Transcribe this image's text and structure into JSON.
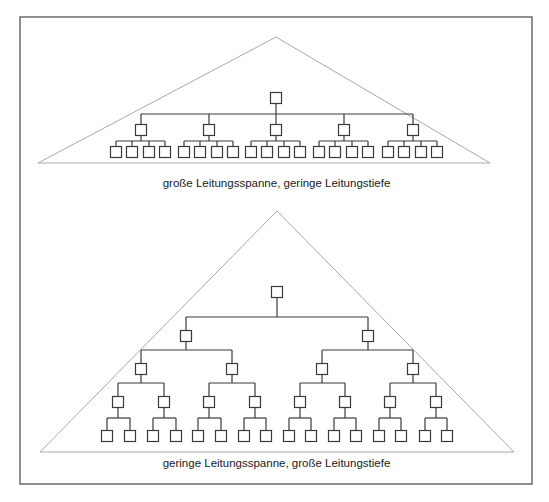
{
  "figure": {
    "frame": {
      "x": 20,
      "y": 17,
      "width": 512,
      "height": 467,
      "stroke": "#555555"
    },
    "colors": {
      "triangle_stroke": "#a8a8a8",
      "tree_stroke": "#3a3a3a",
      "box_fill": "#ffffff",
      "text": "#1a1a1a"
    }
  },
  "diagrams": [
    {
      "id": "wide",
      "caption": "große Leitungsspanne, geringe Leitungstiefe",
      "caption_y": 177,
      "triangle": {
        "apex": [
          276,
          37
        ],
        "left": [
          38,
          163
        ],
        "right": [
          490,
          163
        ]
      },
      "box_size": 11,
      "root": {
        "x": 276,
        "y": 98
      },
      "bus_y": 114,
      "groups": [
        {
          "x": 141,
          "y": 130,
          "child_bus_y": 141,
          "leaves": [
            116,
            132,
            149,
            165
          ],
          "leaf_y": 152
        },
        {
          "x": 209,
          "y": 130,
          "child_bus_y": 141,
          "leaves": [
            184,
            200,
            217,
            233
          ],
          "leaf_y": 152
        },
        {
          "x": 276,
          "y": 130,
          "child_bus_y": 141,
          "leaves": [
            251,
            267,
            284,
            300
          ],
          "leaf_y": 152
        },
        {
          "x": 344,
          "y": 130,
          "child_bus_y": 141,
          "leaves": [
            319,
            335,
            352,
            368
          ],
          "leaf_y": 152
        },
        {
          "x": 413,
          "y": 130,
          "child_bus_y": 141,
          "leaves": [
            388,
            404,
            421,
            437
          ],
          "leaf_y": 152
        }
      ]
    },
    {
      "id": "deep",
      "caption": "geringe Leitungsspanne, große Leitungstiefe",
      "caption_y": 457,
      "triangle": {
        "apex": [
          277,
          211
        ],
        "left": [
          40,
          452
        ],
        "right": [
          514,
          452
        ]
      },
      "box_size": 11,
      "levels_y": [
        292,
        336,
        369,
        402,
        436
      ],
      "bus_y": [
        317,
        350,
        383,
        418
      ],
      "tree": {
        "x": 277,
        "children": [
          {
            "x": 186,
            "children": [
              {
                "x": 141,
                "children": [
                  {
                    "x": 118,
                    "children": [
                      {
                        "x": 107
                      },
                      {
                        "x": 130
                      }
                    ]
                  },
                  {
                    "x": 164,
                    "children": [
                      {
                        "x": 153
                      },
                      {
                        "x": 176
                      }
                    ]
                  }
                ]
              },
              {
                "x": 232,
                "children": [
                  {
                    "x": 209,
                    "children": [
                      {
                        "x": 198
                      },
                      {
                        "x": 221
                      }
                    ]
                  },
                  {
                    "x": 255,
                    "children": [
                      {
                        "x": 244
                      },
                      {
                        "x": 266
                      }
                    ]
                  }
                ]
              }
            ]
          },
          {
            "x": 368,
            "children": [
              {
                "x": 322,
                "children": [
                  {
                    "x": 300,
                    "children": [
                      {
                        "x": 289
                      },
                      {
                        "x": 311
                      }
                    ]
                  },
                  {
                    "x": 345,
                    "children": [
                      {
                        "x": 334
                      },
                      {
                        "x": 356
                      }
                    ]
                  }
                ]
              },
              {
                "x": 413,
                "children": [
                  {
                    "x": 390,
                    "children": [
                      {
                        "x": 379
                      },
                      {
                        "x": 401
                      }
                    ]
                  },
                  {
                    "x": 436,
                    "children": [
                      {
                        "x": 425
                      },
                      {
                        "x": 447
                      }
                    ]
                  }
                ]
              }
            ]
          }
        ]
      }
    }
  ]
}
